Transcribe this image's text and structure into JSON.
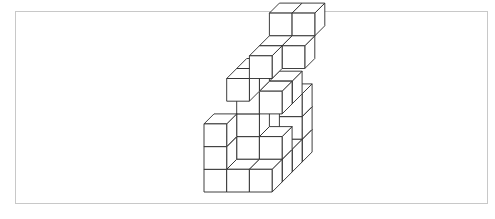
{
  "diagram": {
    "type": "isometric-cube-stack",
    "stroke": "#2a2a2a",
    "frame_color": "#c8c8c8",
    "unit": 22.7,
    "depth_dx": 10,
    "depth_dy": -10,
    "origin": [
      204,
      192
    ],
    "cubes": [
      {
        "x": 0,
        "y": 0,
        "z": 0
      },
      {
        "x": 1,
        "y": 0,
        "z": 0
      },
      {
        "x": 2,
        "y": 0,
        "z": 0
      },
      {
        "x": 2,
        "y": 0,
        "z": 1
      },
      {
        "x": 2,
        "y": 0,
        "z": 2
      },
      {
        "x": 0,
        "y": 1,
        "z": 0
      },
      {
        "x": 0,
        "y": 2,
        "z": 0
      },
      {
        "x": 1,
        "y": 1,
        "z": 1
      },
      {
        "x": 2,
        "y": 1,
        "z": 1
      },
      {
        "x": 2,
        "y": 0,
        "z": 3
      },
      {
        "x": 2,
        "y": 1,
        "z": 3
      },
      {
        "x": 2,
        "y": 2,
        "z": 3
      },
      {
        "x": 1,
        "y": 2,
        "z": 1
      },
      {
        "x": 1,
        "y": 3,
        "z": 1
      },
      {
        "x": 2,
        "y": 3,
        "z": 1
      },
      {
        "x": 2,
        "y": 3,
        "z": 2
      },
      {
        "x": 1,
        "y": 4,
        "z": 0
      },
      {
        "x": 1,
        "y": 4,
        "z": 1
      },
      {
        "x": 2,
        "y": 5,
        "z": 0
      },
      {
        "x": 2,
        "y": 5,
        "z": 1
      },
      {
        "x": 3,
        "y": 5,
        "z": 1
      },
      {
        "x": 2,
        "y": 6,
        "z": 2
      },
      {
        "x": 3,
        "y": 6,
        "z": 2
      }
    ]
  }
}
